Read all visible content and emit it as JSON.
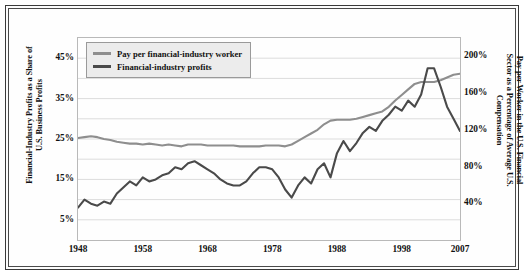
{
  "chart_data": {
    "type": "line",
    "title": "",
    "xlabel": "",
    "ylabel": "Financial-Industry Profits as a Share of U.S. Business Profits",
    "y2label": "Pay per Worker in the U.S. Financial Sector as a Percentage of Average U.S. Compensation",
    "xlim": [
      1948,
      2007
    ],
    "ylim": [
      0,
      50
    ],
    "y2lim": [
      0,
      220
    ],
    "grid": true,
    "legend_position": "top-left",
    "xticks": [
      "1948",
      "1958",
      "1968",
      "1978",
      "1988",
      "1998",
      "2007"
    ],
    "xtick_values": [
      1948,
      1958,
      1968,
      1978,
      1988,
      1998,
      2007
    ],
    "yticks": [
      "5%",
      "15%",
      "25%",
      "35%",
      "45%"
    ],
    "ytick_values": [
      5,
      15,
      25,
      35,
      45
    ],
    "y2ticks": [
      "40%",
      "80%",
      "120%",
      "160%",
      "200%"
    ],
    "y2tick_values": [
      40,
      80,
      120,
      160,
      200
    ],
    "colors": {
      "pay": "#8e8e8e",
      "profits": "#4a4a4a",
      "grid": "#dcdcdc",
      "frame": "#3a3a3a",
      "legend_fill": "#ececec",
      "legend_border": "#9a9a9a"
    },
    "series": [
      {
        "name": "Pay per financial-industry worker",
        "axis": "right",
        "color": "#8e8e8e",
        "x": [
          1948,
          1949,
          1950,
          1951,
          1952,
          1953,
          1954,
          1955,
          1956,
          1957,
          1958,
          1959,
          1960,
          1961,
          1962,
          1963,
          1964,
          1965,
          1966,
          1967,
          1968,
          1969,
          1970,
          1971,
          1972,
          1973,
          1974,
          1975,
          1976,
          1977,
          1978,
          1979,
          1980,
          1981,
          1982,
          1983,
          1984,
          1985,
          1986,
          1987,
          1988,
          1989,
          1990,
          1991,
          1992,
          1993,
          1994,
          1995,
          1996,
          1997,
          1998,
          1999,
          2000,
          2001,
          2002,
          2003,
          2004,
          2005,
          2006,
          2007
        ],
        "values": [
          111,
          112,
          113,
          112,
          110,
          109,
          107,
          106,
          105,
          105,
          104,
          105,
          104,
          103,
          104,
          103,
          102,
          104,
          104,
          104,
          103,
          103,
          103,
          103,
          103,
          102,
          102,
          102,
          102,
          103,
          103,
          103,
          102,
          104,
          108,
          112,
          116,
          120,
          126,
          130,
          131,
          131,
          131,
          132,
          134,
          136,
          138,
          140,
          145,
          152,
          158,
          164,
          170,
          172,
          172,
          172,
          174,
          177,
          180,
          181
        ]
      },
      {
        "name": "Financial-industry profits",
        "axis": "left",
        "color": "#4a4a4a",
        "x": [
          1948,
          1949,
          1950,
          1951,
          1952,
          1953,
          1954,
          1955,
          1956,
          1957,
          1958,
          1959,
          1960,
          1961,
          1962,
          1963,
          1964,
          1965,
          1966,
          1967,
          1968,
          1969,
          1970,
          1971,
          1972,
          1973,
          1974,
          1975,
          1976,
          1977,
          1978,
          1979,
          1980,
          1981,
          1982,
          1983,
          1984,
          1985,
          1986,
          1987,
          1988,
          1989,
          1990,
          1991,
          1992,
          1993,
          1994,
          1995,
          1996,
          1997,
          1998,
          1999,
          2000,
          2001,
          2002,
          2003,
          2004,
          2005,
          2006,
          2007
        ],
        "values": [
          8.0,
          10.0,
          9.0,
          8.5,
          9.5,
          9.0,
          11.5,
          13.0,
          14.5,
          13.5,
          15.5,
          14.5,
          15.0,
          16.0,
          16.5,
          18.0,
          17.5,
          19.0,
          19.5,
          18.5,
          17.5,
          16.5,
          15.0,
          14.0,
          13.5,
          13.5,
          14.5,
          16.5,
          18.0,
          18.0,
          17.5,
          15.5,
          12.5,
          10.5,
          13.5,
          15.5,
          14.0,
          17.5,
          19.0,
          15.5,
          21.5,
          24.5,
          22.0,
          24.0,
          26.5,
          28.0,
          27.0,
          29.5,
          31.0,
          33.0,
          32.0,
          34.5,
          33.0,
          36.0,
          42.5,
          42.5,
          38.0,
          33.0,
          30.0,
          27.0
        ]
      }
    ]
  },
  "legend": {
    "items": [
      {
        "label": "Pay per financial-industry worker"
      },
      {
        "label": "Financial-industry profits"
      }
    ]
  },
  "axes": {
    "left_title": "Financial-Industry Profits as a Share of U.S. Business Profits",
    "right_title": "Pay per Worker in the U.S. Financial Sector as a Percentage of Average U.S. Compensation"
  }
}
